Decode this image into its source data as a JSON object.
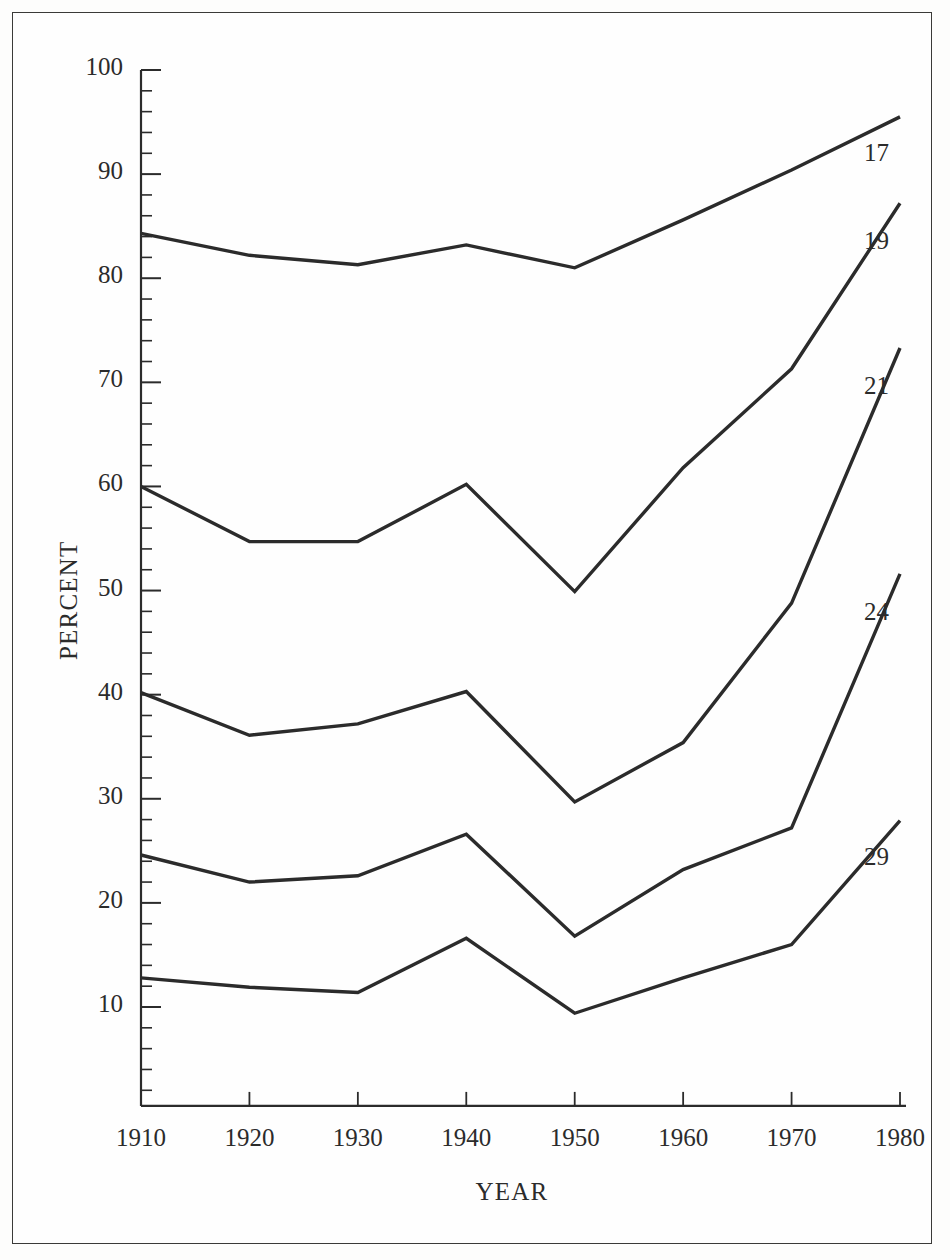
{
  "figure": {
    "background": "#fefefe",
    "frame_color": "#3a3a38",
    "line_color": "#2b2b2b"
  },
  "chart_data": {
    "type": "line",
    "title": "",
    "xlabel": "YEAR",
    "ylabel": "PERCENT",
    "x": [
      1910,
      1920,
      1930,
      1940,
      1950,
      1960,
      1970,
      1980
    ],
    "categories": [
      "1910",
      "1920",
      "1930",
      "1940",
      "1950",
      "1960",
      "1970",
      "1980"
    ],
    "xlim": [
      1910,
      1980
    ],
    "ylim": [
      0,
      100
    ],
    "yticks_major": [
      10,
      20,
      30,
      40,
      50,
      60,
      70,
      80,
      90,
      100
    ],
    "yticks_minor_step": 2,
    "ytick_labels": [
      "10",
      "20",
      "30",
      "40",
      "50",
      "60",
      "70",
      "80",
      "90",
      "100"
    ],
    "grid": false,
    "legend_position": "right-inline",
    "series": [
      {
        "name": "17",
        "label": "17",
        "values": [
          84.3,
          82.2,
          81.3,
          83.2,
          81.0,
          85.6,
          90.4,
          95.5
        ]
      },
      {
        "name": "19",
        "label": "19",
        "values": [
          60.0,
          54.7,
          54.7,
          60.2,
          49.9,
          61.8,
          71.3,
          87.2
        ]
      },
      {
        "name": "21",
        "label": "21",
        "values": [
          40.2,
          36.1,
          37.2,
          40.3,
          29.7,
          35.4,
          48.8,
          73.3
        ]
      },
      {
        "name": "24",
        "label": "24",
        "values": [
          24.6,
          22.0,
          22.6,
          26.6,
          16.8,
          23.2,
          27.2,
          51.6
        ]
      },
      {
        "name": "29",
        "label": "29",
        "values": [
          12.8,
          11.9,
          11.4,
          16.6,
          9.4,
          12.8,
          16.0,
          27.9
        ]
      }
    ]
  }
}
